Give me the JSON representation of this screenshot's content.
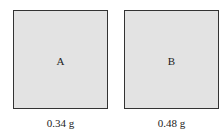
{
  "figure": {
    "samples": [
      {
        "label": "A",
        "mass": "0.34 g"
      },
      {
        "label": "B",
        "mass": "0.48 g"
      }
    ],
    "colors": {
      "fill": "#e3e3e3",
      "border": "#333333"
    }
  }
}
